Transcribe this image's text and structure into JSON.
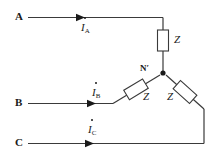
{
  "diagram": {
    "background_color": "#ffffff",
    "line_color": "#3a3a3a",
    "text_color": "#1a1a1a"
  },
  "terminals": [
    {
      "id": "a",
      "label": "A"
    },
    {
      "id": "b",
      "label": "B"
    },
    {
      "id": "c",
      "label": "C"
    }
  ],
  "node": {
    "label": "N′"
  },
  "currents": [
    {
      "id": "ia",
      "symbol": "I",
      "subscript": "A"
    },
    {
      "id": "ib",
      "symbol": "I",
      "subscript": "B"
    },
    {
      "id": "ic",
      "symbol": "I",
      "subscript": "C"
    }
  ],
  "impedances": [
    {
      "id": "z-a",
      "label": "Z"
    },
    {
      "id": "z-b",
      "label": "Z"
    },
    {
      "id": "z-c",
      "label": "Z"
    }
  ]
}
